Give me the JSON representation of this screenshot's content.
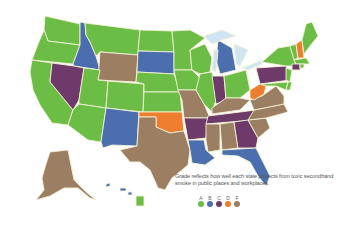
{
  "map": {
    "title": "Smoke-free grades by US state",
    "caption": "Grade reflects how well each state protects from toxic secondhand smoke in public places and workplaces.",
    "legend": [
      {
        "grade": "A",
        "color": "#6cbd45"
      },
      {
        "grade": "B",
        "color": "#4b6fae"
      },
      {
        "grade": "C",
        "color": "#6e3a6a"
      },
      {
        "grade": "D",
        "color": "#ee7d2e"
      },
      {
        "grade": "F",
        "color": "#9c7f63"
      }
    ],
    "states": {
      "WA": "A",
      "OR": "A",
      "CA": "A",
      "ID": "B",
      "NV": "C",
      "MT": "A",
      "WY": "F",
      "UT": "A",
      "AZ": "A",
      "CO": "A",
      "NM": "B",
      "ND": "A",
      "SD": "B",
      "NE": "A",
      "KS": "A",
      "OK": "D",
      "TX": "F",
      "MN": "A",
      "IA": "A",
      "MO": "F",
      "AR": "C",
      "LA": "B",
      "WI": "A",
      "IL": "A",
      "MI": "B",
      "IN": "C",
      "OH": "A",
      "KY": "F",
      "TN": "C",
      "MS": "F",
      "AL": "F",
      "GA": "C",
      "FL": "B",
      "SC": "F",
      "NC": "F",
      "VA": "F",
      "WV": "D",
      "PA": "C",
      "NY": "A",
      "VT": "A",
      "NH": "D",
      "ME": "A",
      "MA": "A",
      "RI": "A",
      "CT": "C",
      "NJ": "A",
      "DE": "A",
      "MD": "A",
      "AK": "F",
      "HI": "A"
    }
  }
}
